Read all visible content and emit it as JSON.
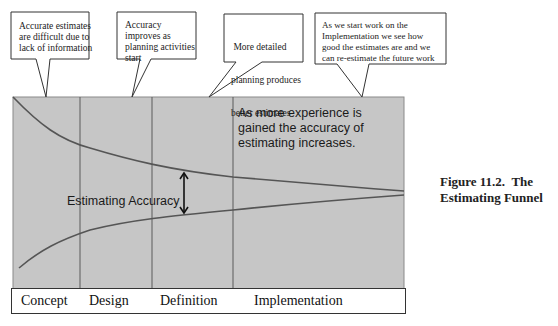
{
  "diagram": {
    "type": "estimating-funnel",
    "colors": {
      "chart_fill": "#c6c6c6",
      "chart_border": "#888888",
      "curve": "#555555",
      "divider": "#555555",
      "text": "#222222"
    },
    "callouts": [
      {
        "text_lines": [
          "Accurate estimates",
          "are difficult due to",
          "lack of information"
        ]
      },
      {
        "text_lines": [
          "Accuracy",
          "improves as",
          "planning activities",
          "start"
        ]
      },
      {
        "text_lines": [
          " More detailed",
          "planning produces",
          "better estimates"
        ]
      },
      {
        "text_lines": [
          "As we start work on the",
          "Implementation we see how",
          "good the estimates are and we",
          "can re-estimate the future work"
        ]
      }
    ],
    "chart_note": {
      "lines": [
        "As more experience is",
        "gained the accuracy of",
        "estimating increases."
      ]
    },
    "accuracy_label": "Estimating Accuracy",
    "phases": [
      "Concept",
      "Design",
      "Definition",
      "Implementation"
    ],
    "caption": {
      "line1": "Figure 11.2.  The",
      "line2": "Estimating Funnel"
    }
  }
}
